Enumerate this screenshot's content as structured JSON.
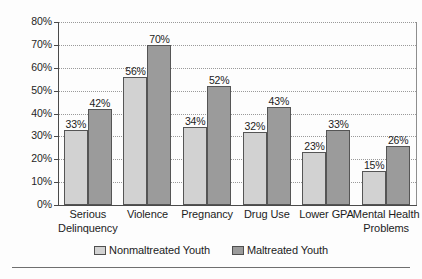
{
  "chart_data": {
    "type": "bar",
    "title": "",
    "xlabel": "",
    "ylabel": "",
    "ylim": [
      0,
      80
    ],
    "ytick_labels": [
      "0%",
      "10%",
      "20%",
      "30%",
      "40%",
      "50%",
      "60%",
      "70%",
      "80%"
    ],
    "ytick_values": [
      0,
      10,
      20,
      30,
      40,
      50,
      60,
      70,
      80
    ],
    "grid": "horizontal-dotted",
    "legend_position": "bottom-center",
    "value_suffix": "%",
    "categories": [
      "Serious Delinquency",
      "Violence",
      "Pregnancy",
      "Drug Use",
      "Lower GPA",
      "Mental Health Problems"
    ],
    "category_lines": [
      [
        "Serious",
        "Delinquency"
      ],
      [
        "Violence"
      ],
      [
        "Pregnancy"
      ],
      [
        "Drug Use"
      ],
      [
        "Lower GPA"
      ],
      [
        "Mental Health",
        "Problems"
      ]
    ],
    "series": [
      {
        "name": "Nonmaltreated Youth",
        "color": "#d2d2d2",
        "values": [
          33,
          56,
          34,
          32,
          23,
          15
        ],
        "labels": [
          "33%",
          "56%",
          "34%",
          "32%",
          "23%",
          "15%"
        ]
      },
      {
        "name": "Maltreated Youth",
        "color": "#9b9b9b",
        "values": [
          42,
          70,
          52,
          43,
          33,
          26
        ],
        "labels": [
          "42%",
          "70%",
          "52%",
          "43%",
          "33%",
          "26%"
        ]
      }
    ]
  },
  "legend": {
    "items": [
      {
        "label": "Nonmaltreated Youth",
        "swatch": "light"
      },
      {
        "label": "Maltreated Youth",
        "swatch": "dark"
      }
    ]
  }
}
